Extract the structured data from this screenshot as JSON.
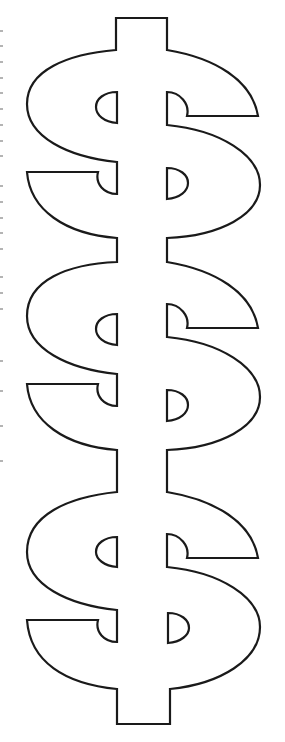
{
  "illustration": {
    "subject": "three stacked dollar signs outline",
    "count": 3,
    "stroke_color": "#1a1a1a",
    "fill_color": "#ffffff",
    "background": "#ffffff"
  },
  "icons": [
    "dollar-sign-icon",
    "dollar-sign-icon",
    "dollar-sign-icon"
  ]
}
